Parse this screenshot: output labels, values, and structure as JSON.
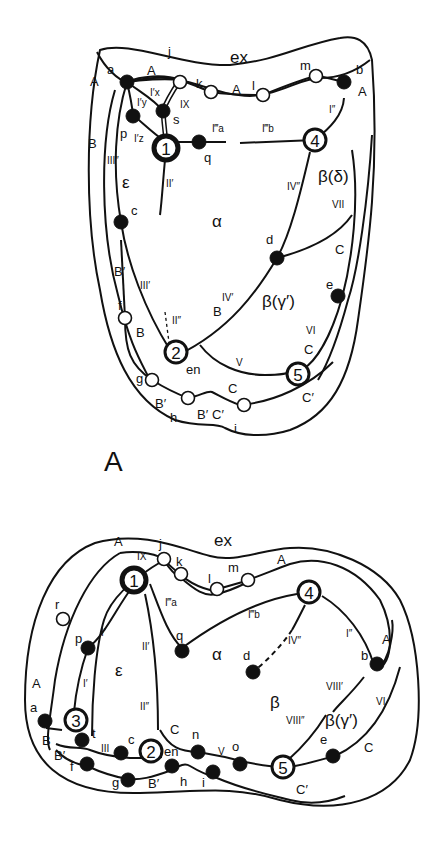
{
  "panel_a": {
    "panel_label": "A",
    "regions": {
      "ex": "ex",
      "epsilon": "ε",
      "alpha": "α",
      "beta_delta": "β(δ)",
      "beta_gamma": "β(γ′)"
    },
    "hubs": [
      "1",
      "2",
      "4",
      "5"
    ],
    "filled_nodes": [
      "a",
      "b",
      "p",
      "s",
      "q",
      "c",
      "d",
      "e"
    ],
    "open_nodes": [
      "j",
      "k",
      "l",
      "m",
      "f",
      "g",
      "h",
      "i"
    ],
    "node_labels": {
      "a": "a",
      "b": "b",
      "j": "j",
      "k": "k",
      "l": "l",
      "m": "m",
      "p": "p",
      "s": "s",
      "q": "q",
      "c": "c",
      "d": "d",
      "e": "e",
      "f": "f",
      "g": "g",
      "h": "h",
      "i": "i",
      "en": "en"
    },
    "edge_labels": {
      "A1": "A",
      "A2": "A",
      "A3": "A",
      "A4": "A",
      "B1": "B",
      "B2": "B",
      "B3": "B",
      "Bp1": "B′",
      "Bp2": "B′",
      "Bp3": "B′",
      "C1": "C",
      "C2": "C",
      "C3": "C",
      "Cp1": "C′",
      "Cp2": "C′",
      "Ix": "I′x",
      "Iy": "I′y",
      "Iz": "I′z",
      "IX": "IX",
      "Ia": "I‴a",
      "Ib": "I‴b",
      "I2": "I″",
      "II1": "II′",
      "II2": "II″",
      "III1": "III′",
      "III2": "III″",
      "IV1": "IV′",
      "IV2": "IV″",
      "V": "V",
      "VI": "VI",
      "VII": "VII"
    }
  },
  "panel_b": {
    "regions": {
      "ex": "ex",
      "epsilon": "ε",
      "alpha": "α",
      "beta": "β",
      "beta_gamma": "β(γ′)"
    },
    "hubs": [
      "1",
      "2",
      "3",
      "4",
      "5"
    ],
    "filled_nodes": [
      "p",
      "q",
      "a",
      "t",
      "c",
      "f",
      "g",
      "h",
      "n",
      "i",
      "o",
      "e",
      "b",
      "d"
    ],
    "open_nodes": [
      "r",
      "j",
      "k",
      "l",
      "m"
    ],
    "node_labels": {
      "r": "r",
      "j": "j",
      "k": "k",
      "l": "l",
      "m": "m",
      "p": "p",
      "q": "q",
      "a": "a",
      "t": "t",
      "c": "c",
      "f": "f",
      "g": "g",
      "h": "h",
      "n": "n",
      "i": "i",
      "o": "o",
      "e": "e",
      "b": "b",
      "d": "d",
      "en": "en"
    },
    "edge_labels": {
      "A1": "A",
      "A2": "A",
      "A3": "A",
      "B": "B",
      "Bp1": "B′",
      "Bp2": "B′",
      "C1": "C",
      "C2": "C",
      "Cp": "C′",
      "IX": "IX",
      "I1": "I′",
      "I1b": "I′",
      "I2": "I″",
      "Ia": "I‴a",
      "Ib": "I‴b",
      "II1": "II′",
      "II2": "II″",
      "III": "III",
      "IV2": "IV″",
      "V": "V",
      "VI": "VI",
      "VIII1": "VIII′",
      "VIII2": "VIII″"
    }
  }
}
